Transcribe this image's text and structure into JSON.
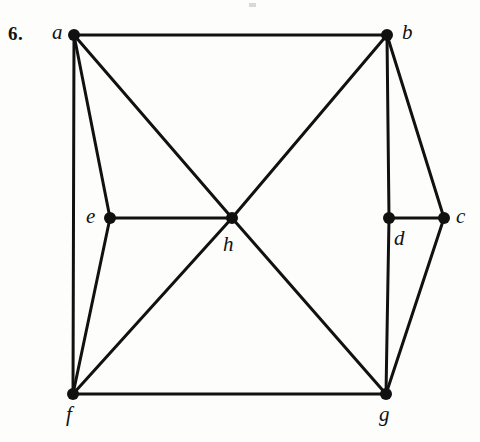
{
  "figure": {
    "problem_number": "6.",
    "type": "undirected-graph-diagram",
    "background_color": "#fdfdfc",
    "stroke_color": "#111111",
    "node_color": "#111111",
    "edge_width_px": 3,
    "node_radius_px": 6,
    "canvas": {
      "width": 480,
      "height": 442
    }
  },
  "graph_data": {
    "type": "graph",
    "directed": false,
    "node_count": 8,
    "edge_count": 15,
    "nodes": [
      {
        "id": "a",
        "label": "a",
        "x": 74,
        "y": 35,
        "label_x": 52,
        "label_y": 22,
        "degree": 4
      },
      {
        "id": "b",
        "label": "b",
        "x": 387,
        "y": 35,
        "label_x": 402,
        "label_y": 22,
        "degree": 4
      },
      {
        "id": "c",
        "label": "c",
        "x": 444,
        "y": 218,
        "label_x": 456,
        "label_y": 206,
        "degree": 3
      },
      {
        "id": "d",
        "label": "d",
        "x": 389,
        "y": 218,
        "label_x": 394,
        "label_y": 228,
        "degree": 3
      },
      {
        "id": "e",
        "label": "e",
        "x": 110,
        "y": 218,
        "label_x": 86,
        "label_y": 206,
        "degree": 3
      },
      {
        "id": "f",
        "label": "f",
        "x": 73,
        "y": 394,
        "label_x": 66,
        "label_y": 404,
        "degree": 4
      },
      {
        "id": "g",
        "label": "g",
        "x": 386,
        "y": 394,
        "label_x": 379,
        "label_y": 404,
        "degree": 4
      },
      {
        "id": "h",
        "label": "h",
        "x": 232,
        "y": 218,
        "label_x": 223,
        "label_y": 234,
        "degree": 5
      }
    ],
    "edges": [
      {
        "from": "a",
        "to": "b"
      },
      {
        "from": "a",
        "to": "e"
      },
      {
        "from": "a",
        "to": "f"
      },
      {
        "from": "a",
        "to": "h"
      },
      {
        "from": "b",
        "to": "c"
      },
      {
        "from": "b",
        "to": "d"
      },
      {
        "from": "b",
        "to": "h"
      },
      {
        "from": "c",
        "to": "d"
      },
      {
        "from": "c",
        "to": "g"
      },
      {
        "from": "d",
        "to": "g"
      },
      {
        "from": "e",
        "to": "f"
      },
      {
        "from": "e",
        "to": "h"
      },
      {
        "from": "f",
        "to": "g"
      },
      {
        "from": "f",
        "to": "h"
      },
      {
        "from": "g",
        "to": "h"
      }
    ]
  },
  "artifacts": [
    {
      "name": "scan-speck-top",
      "x": 249,
      "y": 3,
      "width": 7,
      "height": 4
    }
  ]
}
